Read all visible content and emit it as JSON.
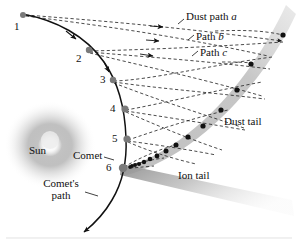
{
  "figure": {
    "type": "diagram"
  },
  "colors": {
    "orbit_line": "#111111",
    "dashed_path": "#333333",
    "position_dot": "#7a7a7a",
    "dust_particle_dot": "#111111",
    "dust_tail_band": "#c9c9c9",
    "ion_tail_band": "#b0b0b0",
    "sun_glow": "#9a9a9a",
    "text": "#111111",
    "background": "#ffffff",
    "caption_rule": "#cccccc"
  },
  "labels": {
    "dust_path_a": "Dust path",
    "dust_path_a_italic": "a",
    "path_b": "Path",
    "path_b_italic": "b",
    "path_c": "Path",
    "path_c_italic": "c",
    "dust_tail": "Dust tail",
    "ion_tail": "Ion tail",
    "sun": "Sun",
    "comet": "Comet",
    "comets_path_line1": "Comet's",
    "comets_path_line2": "path"
  },
  "positions": {
    "numbers": [
      "1",
      "2",
      "3",
      "4",
      "5",
      "6"
    ],
    "coords": [
      {
        "n": "1",
        "x": 23,
        "y": 15,
        "lx": 14,
        "ly": 20
      },
      {
        "n": "2",
        "x": 88,
        "y": 50,
        "lx": 78,
        "ly": 53
      },
      {
        "n": "3",
        "x": 112,
        "y": 80,
        "lx": 103,
        "ly": 76
      },
      {
        "n": "4",
        "x": 124,
        "y": 109,
        "lx": 112,
        "ly": 104
      },
      {
        "n": "5",
        "x": 126,
        "y": 139,
        "lx": 114,
        "ly": 134
      },
      {
        "n": "6",
        "x": 122,
        "y": 168,
        "lx": 108,
        "ly": 165
      }
    ]
  },
  "dust_particles": {
    "count": 18,
    "description": "black dots along the dust tail arc"
  },
  "paths": {
    "orbit_description": "comet's hyperbolic path curving past the Sun",
    "dashed_description": "dust particle trajectories released at positions 1-6"
  }
}
